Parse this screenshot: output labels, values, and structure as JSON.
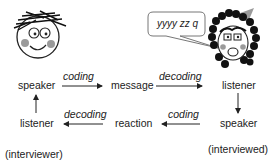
{
  "diagram": {
    "nodes": {
      "speaker_top": "speaker",
      "message": "message",
      "listener_top": "listener",
      "listener_bottom": "listener",
      "reaction": "reaction",
      "speaker_bottom": "speaker"
    },
    "edges": {
      "speaker_to_message": "coding",
      "message_to_listener": "decoding",
      "reaction_to_listener": "decoding",
      "speaker_to_reaction": "coding"
    },
    "roles": {
      "left": "(interviewer)",
      "right": "(interviewed)"
    },
    "speech_bubble": "yyyy zz q"
  },
  "colors": {
    "ink": "#222222",
    "cheek": "#9a9a9a",
    "hair": "#111111",
    "bubble_border": "#777777"
  }
}
